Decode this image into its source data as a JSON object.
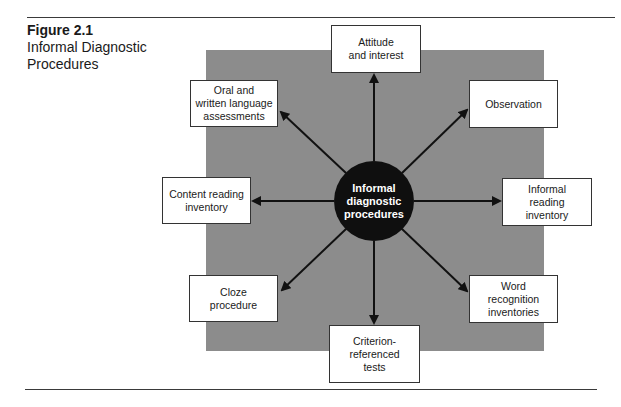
{
  "figure": {
    "number": "Figure 2.1",
    "title_line1": "Informal Diagnostic",
    "title_line2": "Procedures"
  },
  "hub": {
    "line1": "Informal",
    "line2": "diagnostic",
    "line3": "procedures"
  },
  "nodes": [
    {
      "id": "attitude",
      "line1": "Attitude",
      "line2": "and interest"
    },
    {
      "id": "observation",
      "line1": "Observation"
    },
    {
      "id": "informal-reading-inventory",
      "line1": "Informal",
      "line2": "reading inventory"
    },
    {
      "id": "word-recognition",
      "line1": "Word recognition",
      "line2": "inventories"
    },
    {
      "id": "criterion",
      "line1": "Criterion-",
      "line2": "referenced",
      "line3": "tests"
    },
    {
      "id": "cloze",
      "line1": "Cloze",
      "line2": "procedure"
    },
    {
      "id": "content-reading",
      "line1": "Content reading",
      "line2": "inventory"
    },
    {
      "id": "oral-written",
      "line1": "Oral and",
      "line2": "written language",
      "line3": "assessments"
    }
  ],
  "colors": {
    "background_panel": "#8c8c8c",
    "hub_fill": "#0f0f0f",
    "arrow": "#111111"
  }
}
